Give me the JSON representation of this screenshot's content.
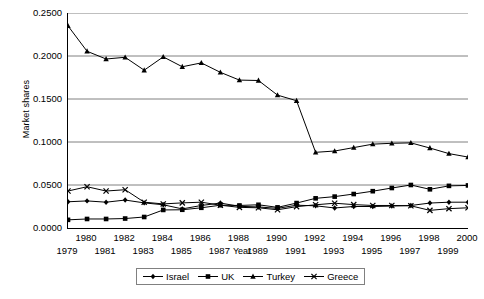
{
  "chart_data": {
    "type": "line",
    "title": "",
    "xlabel": "Year",
    "ylabel": "Market shares",
    "grid": "horizontal",
    "legend_position": "bottom",
    "xlim": [
      1979,
      2000
    ],
    "ylim": [
      0.0,
      0.25
    ],
    "ytick_labels": [
      "0.0000",
      "0.0500",
      "0.1000",
      "0.1500",
      "0.2000",
      "0.2500"
    ],
    "ytick_values": [
      0.0,
      0.05,
      0.1,
      0.15,
      0.2,
      0.25
    ],
    "x": [
      1979,
      1980,
      1981,
      1982,
      1983,
      1984,
      1985,
      1986,
      1987,
      1988,
      1989,
      1990,
      1991,
      1992,
      1993,
      1994,
      1995,
      1996,
      1997,
      1998,
      1999,
      2000
    ],
    "xtick_labels": [
      "1979",
      "1980",
      "1981",
      "1982",
      "1983",
      "1984",
      "1985",
      "1986",
      "1987",
      "1988",
      "1989",
      "1990",
      "1991",
      "1992",
      "1993",
      "1994",
      "1995",
      "1996",
      "1997",
      "1998",
      "1999",
      "2000"
    ],
    "series": [
      {
        "name": "Israel",
        "marker": "diamond",
        "color": "#000000",
        "values": [
          0.0305,
          0.0315,
          0.03,
          0.0325,
          0.0292,
          0.027,
          0.0222,
          0.0262,
          0.029,
          0.0252,
          0.0245,
          0.0228,
          0.0265,
          0.0258,
          0.0233,
          0.025,
          0.025,
          0.0255,
          0.0262,
          0.029,
          0.03,
          0.03
        ]
      },
      {
        "name": "UK",
        "marker": "square",
        "color": "#000000",
        "values": [
          0.0095,
          0.0105,
          0.0105,
          0.011,
          0.0128,
          0.021,
          0.0212,
          0.0235,
          0.0265,
          0.0262,
          0.027,
          0.024,
          0.029,
          0.0345,
          0.0365,
          0.0395,
          0.0428,
          0.0465,
          0.05,
          0.045,
          0.049,
          0.0495
        ]
      },
      {
        "name": "Turkey",
        "marker": "triangle",
        "color": "#000000",
        "values": [
          0.235,
          0.2055,
          0.1965,
          0.1985,
          0.1835,
          0.199,
          0.1875,
          0.192,
          0.181,
          0.172,
          0.1715,
          0.1545,
          0.148,
          0.088,
          0.0895,
          0.0935,
          0.0975,
          0.0985,
          0.099,
          0.093,
          0.0865,
          0.0825
        ]
      },
      {
        "name": "Greece",
        "marker": "x",
        "color": "#000000",
        "values": [
          0.043,
          0.048,
          0.043,
          0.0445,
          0.03,
          0.028,
          0.0292,
          0.03,
          0.0265,
          0.024,
          0.0235,
          0.0212,
          0.0248,
          0.027,
          0.0288,
          0.0272,
          0.0262,
          0.0262,
          0.0258,
          0.0205,
          0.0225,
          0.0235
        ]
      }
    ]
  },
  "legend": {
    "items": [
      {
        "label": "Israel"
      },
      {
        "label": "UK"
      },
      {
        "label": "Turkey"
      },
      {
        "label": "Greece"
      }
    ]
  }
}
